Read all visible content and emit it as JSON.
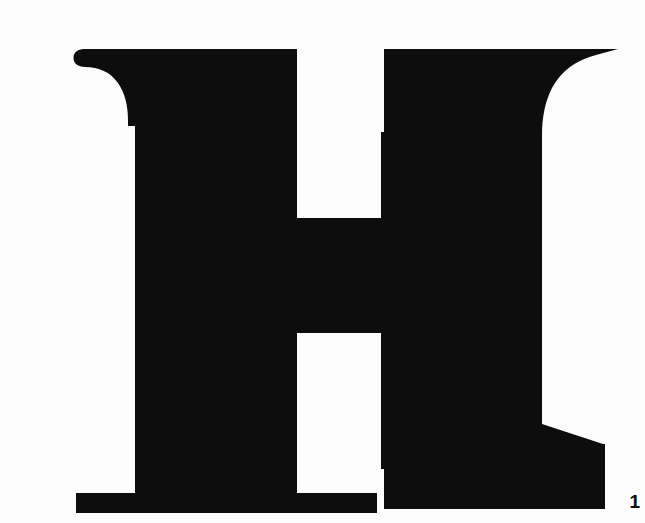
{
  "page": {
    "background_color": "#fcfcfc",
    "ink_color": "#0d0d0d",
    "width": 616,
    "height": 523
  },
  "figure": {
    "caption_number": "1",
    "glyph_character": "H",
    "glyph_name": "capital-letter-h",
    "style": "serif-didone-slab",
    "alt_text": "Large black serif capital letter H"
  },
  "glyph_geometry": {
    "description": "Outline coordinates of the capital H in a 616 x 523 viewport",
    "left_stem": {
      "left_edge": 95,
      "right_edge": 257,
      "top": 33,
      "bottom": 497
    },
    "right_stem": {
      "left_edge": 341,
      "right_edge": 502,
      "top": 33,
      "bottom": 493
    },
    "crossbar": {
      "top": 202,
      "bottom": 317,
      "left": 257,
      "right": 341
    },
    "upper_counter": {
      "left": 257,
      "right": 337,
      "top": 31,
      "bottom": 200,
      "diagonal_from": [
        267,
        31
      ],
      "diagonal_to": [
        337,
        100
      ]
    },
    "lower_counter": {
      "left": 262,
      "right": 341,
      "top": 318,
      "bottom": 483,
      "arc_radius": 86
    },
    "top_left_serif": {
      "ball_terminal_x": 34,
      "top": 33,
      "ball_height": 18
    },
    "top_right_serif": {
      "taper_point_x": 578,
      "top": 33
    },
    "bottom_left_serif": {
      "left": 36,
      "top": 477,
      "bottom": 497
    },
    "bottom_right_serif": {
      "ramp_from": [
        502,
        408
      ],
      "ramp_to": [
        563,
        428
      ],
      "right_edge": 565,
      "bottom": 493
    },
    "foot_gap": {
      "left": 337,
      "right": 344
    }
  }
}
